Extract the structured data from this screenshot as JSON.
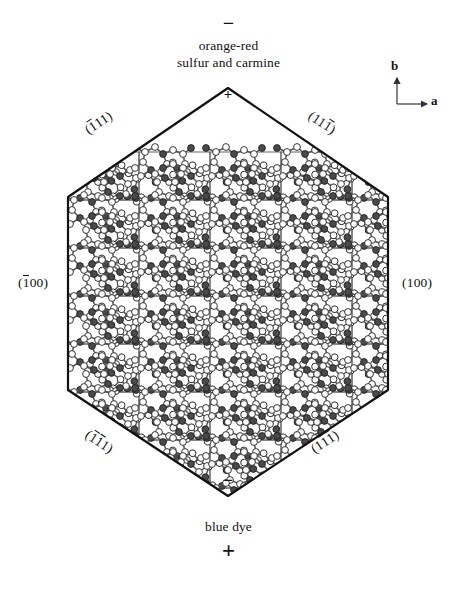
{
  "figure": {
    "type": "crystal-habit-packing-diagram",
    "top_annotation": {
      "polarity_sign": "−",
      "lines": [
        "orange-red",
        "sulfur and carmine"
      ]
    },
    "bottom_annotation": {
      "lines": [
        "blue dye"
      ],
      "polarity_sign": "+"
    },
    "axes": {
      "vertical_label": "b",
      "horizontal_label": "a"
    },
    "vertex_marks": {
      "top": "+",
      "bottom": "−"
    },
    "face_labels": [
      {
        "name": "top-left",
        "prefix": "(",
        "bar1": "1",
        "rest": "11",
        "suffix": ")",
        "plain": "(-111)"
      },
      {
        "name": "top-right",
        "prefix": "(",
        "pre": "11",
        "bar": "1",
        "suffix": ")",
        "plain": "(11-1)"
      },
      {
        "name": "left",
        "prefix": "(",
        "bar1": "1",
        "rest": "00",
        "suffix": ")",
        "plain": "(-100)"
      },
      {
        "name": "right",
        "plain": "(100)"
      },
      {
        "name": "bottom-left",
        "prefix": "(",
        "bar1": "1",
        "bar2": "1",
        "rest": "1",
        "suffix": ")",
        "plain": "(-1-11)"
      },
      {
        "name": "bottom-right",
        "prefix": "(",
        "pre": "1",
        "bar1": "1",
        "bar2": "1",
        "suffix": ")",
        "plain": "(1-1-1)"
      }
    ],
    "lattice": {
      "columns": 5,
      "rows": 5,
      "cell_width": 71,
      "cell_height": 48
    },
    "colors": {
      "outline": "#111111",
      "cell_grid": "#555555",
      "atom_light_fill": "#ffffff",
      "atom_dark_fill": "#4a4a4a",
      "atom_stroke": "#222222",
      "bond": "#555555",
      "background": "#ffffff"
    }
  }
}
